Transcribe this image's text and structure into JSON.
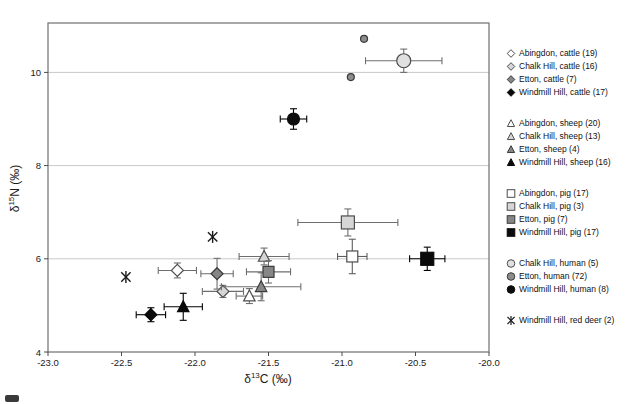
{
  "chart_data": {
    "type": "scatter",
    "xlabel": {
      "pre": "δ",
      "sup": "13",
      "post": "C (‰)"
    },
    "ylabel": {
      "pre": "δ",
      "sup": "15",
      "post": "N (‰)"
    },
    "xlim": [
      -23.0,
      -20.0
    ],
    "ylim": [
      4,
      11.06
    ],
    "xticks": [
      -23.0,
      -22.5,
      -22.0,
      -21.5,
      -21.0,
      -20.5,
      -20.0
    ],
    "xtick_labels": [
      "-23.0",
      "-22.5",
      "-22.0",
      "-21.5",
      "-21.0",
      "-20.5",
      "-20.0"
    ],
    "yticks": [
      4,
      6,
      8,
      10
    ],
    "ytick_labels": [
      "4",
      "6",
      "8",
      "10"
    ],
    "grid_y": [
      6,
      8,
      10
    ],
    "grid_color": "#c9c9c9",
    "frame_color": "#6f6f6f",
    "legend_position": "right",
    "series": [
      {
        "name": "abingdon-cattle",
        "label": "Abingdon, cattle (19)",
        "species": "cattle",
        "count": 19,
        "shape": "diamond",
        "fill": "#ffffff",
        "stroke": "#4d4d4d",
        "err": "#6e6e6e",
        "size": 6,
        "points": [
          {
            "x": -22.12,
            "y": 5.75,
            "xerr": 0.13,
            "yerr": 0.16
          }
        ]
      },
      {
        "name": "chalkhill-cattle",
        "label": "Chalk Hill, cattle (16)",
        "species": "cattle",
        "count": 16,
        "shape": "diamond",
        "fill": "#d6d6d6",
        "stroke": "#4d4d4d",
        "err": "#6e6e6e",
        "size": 6,
        "points": [
          {
            "x": -21.81,
            "y": 5.3,
            "xerr": 0.14,
            "yerr": 0.13
          }
        ]
      },
      {
        "name": "etton-cattle",
        "label": "Etton, cattle (7)",
        "species": "cattle",
        "count": 7,
        "shape": "diamond",
        "fill": "#868686",
        "stroke": "#3a3a3a",
        "err": "#6e6e6e",
        "size": 6,
        "points": [
          {
            "x": -21.85,
            "y": 5.68,
            "xerr": 0.11,
            "yerr": 0.33
          }
        ]
      },
      {
        "name": "windmill-cattle",
        "label": "Windmill Hill, cattle (17)",
        "species": "cattle",
        "count": 17,
        "shape": "diamond",
        "fill": "#0a0a0a",
        "stroke": "#0a0a0a",
        "err": "#000000",
        "size": 6,
        "points": [
          {
            "x": -22.3,
            "y": 4.8,
            "xerr": 0.1,
            "yerr": 0.15
          }
        ]
      },
      {
        "name": "abingdon-sheep",
        "label": "Abingdon, sheep (20)",
        "species": "sheep",
        "count": 20,
        "shape": "triangle",
        "fill": "#ffffff",
        "stroke": "#4d4d4d",
        "err": "#6e6e6e",
        "size": 6,
        "points": [
          {
            "x": -21.63,
            "y": 5.2,
            "xerr": 0.09,
            "yerr": 0.16
          }
        ]
      },
      {
        "name": "chalkhill-sheep",
        "label": "Chalk Hill, sheep (13)",
        "species": "sheep",
        "count": 13,
        "shape": "triangle",
        "fill": "#d6d6d6",
        "stroke": "#4d4d4d",
        "err": "#6e6e6e",
        "size": 6,
        "points": [
          {
            "x": -21.53,
            "y": 6.05,
            "xerr": 0.17,
            "yerr": 0.18
          }
        ]
      },
      {
        "name": "etton-sheep",
        "label": "Etton, sheep (4)",
        "species": "sheep",
        "count": 4,
        "shape": "triangle",
        "fill": "#868686",
        "stroke": "#3a3a3a",
        "err": "#6e6e6e",
        "size": 6,
        "points": [
          {
            "x": -21.55,
            "y": 5.4,
            "xerr": 0.27,
            "yerr": 0.3
          }
        ]
      },
      {
        "name": "windmill-sheep",
        "label": "Windmill Hill, sheep (16)",
        "species": "sheep",
        "count": 16,
        "shape": "triangle",
        "fill": "#0a0a0a",
        "stroke": "#0a0a0a",
        "err": "#000000",
        "size": 6,
        "points": [
          {
            "x": -22.08,
            "y": 4.97,
            "xerr": 0.13,
            "yerr": 0.29
          }
        ]
      },
      {
        "name": "abingdon-pig",
        "label": "Abingdon, pig (17)",
        "species": "pig",
        "count": 17,
        "shape": "square",
        "fill": "#ffffff",
        "stroke": "#4d4d4d",
        "err": "#5e5e5e",
        "size": 5.5,
        "points": [
          {
            "x": -20.93,
            "y": 6.05,
            "xerr": 0.1,
            "yerr": 0.37
          }
        ]
      },
      {
        "name": "chalkhill-pig",
        "label": "Chalk Hill, pig (3)",
        "species": "pig",
        "count": 3,
        "shape": "square",
        "fill": "#d6d6d6",
        "stroke": "#4d4d4d",
        "err": "#6e6e6e",
        "size": 6.5,
        "points": [
          {
            "x": -20.96,
            "y": 6.78,
            "xerr": 0.34,
            "yerr": 0.29
          }
        ]
      },
      {
        "name": "etton-pig",
        "label": "Etton, pig (7)",
        "species": "pig",
        "count": 7,
        "shape": "square",
        "fill": "#868686",
        "stroke": "#3a3a3a",
        "err": "#6e6e6e",
        "size": 5.5,
        "points": [
          {
            "x": -21.5,
            "y": 5.72,
            "xerr": 0.15,
            "yerr": 0.24
          }
        ]
      },
      {
        "name": "windmill-pig",
        "label": "Windmill Hill, pig (17)",
        "species": "pig",
        "count": 17,
        "shape": "square",
        "fill": "#0a0a0a",
        "stroke": "#0a0a0a",
        "err": "#000000",
        "size": 6.5,
        "points": [
          {
            "x": -20.42,
            "y": 6.0,
            "xerr": 0.12,
            "yerr": 0.25
          }
        ]
      },
      {
        "name": "chalkhill-human",
        "label": "Chalk Hill, human (5)",
        "species": "human",
        "count": 5,
        "shape": "circle",
        "fill": "#e0e0e0",
        "stroke": "#4d4d4d",
        "err": "#6e6e6e",
        "size": 7,
        "points": [
          {
            "x": -20.58,
            "y": 10.25,
            "xerr": 0.26,
            "yerr": 0.25
          }
        ]
      },
      {
        "name": "etton-human",
        "label": "Etton, human (72)",
        "species": "human",
        "count": 72,
        "shape": "circle",
        "fill": "#8c8c8c",
        "stroke": "#3a3a3a",
        "err": "#6e6e6e",
        "size": 3.5,
        "points": [
          {
            "x": -20.85,
            "y": 10.72
          },
          {
            "x": -20.94,
            "y": 9.9
          }
        ]
      },
      {
        "name": "windmill-human",
        "label": "Windmill Hill, human (8)",
        "species": "human",
        "count": 8,
        "shape": "circle",
        "fill": "#0d0d0d",
        "stroke": "#0d0d0d",
        "err": "#000000",
        "size": 6,
        "points": [
          {
            "x": -21.33,
            "y": 9.0,
            "xerr": 0.09,
            "yerr": 0.22
          }
        ]
      },
      {
        "name": "windmill-reddeer",
        "label": "Windmill Hill, red deer (2)",
        "species": "red deer",
        "count": 2,
        "shape": "asterisk",
        "fill": "none",
        "stroke": "#1a1a1a",
        "err": "#6e6e6e",
        "size": 6,
        "points": [
          {
            "x": -21.88,
            "y": 6.47
          },
          {
            "x": -22.47,
            "y": 5.61
          }
        ]
      }
    ]
  }
}
